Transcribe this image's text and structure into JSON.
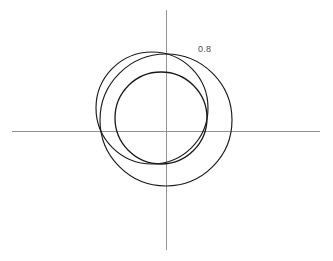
{
  "figure": {
    "background_color": "#ffffff",
    "width": 333,
    "height": 261
  },
  "axes": {
    "x_axis": {
      "name": "horizontal-axis",
      "color": "#8a8a8a",
      "y": 131,
      "x_start": 12,
      "x_end": 320
    },
    "y_axis": {
      "name": "vertical-axis",
      "color": "#8a8a8a",
      "x": 166,
      "y_start": 10,
      "y_end": 250
    },
    "origin": {
      "x": 166,
      "y": 131
    }
  },
  "annotations": [
    {
      "id": "label-08",
      "text": "0.8",
      "x": 198,
      "y": 44,
      "color": "#4a4a4a"
    }
  ],
  "chart_data": {
    "type": "scatter",
    "title": "",
    "subtitle": "",
    "xlabel": "",
    "ylabel": "",
    "grid": false,
    "legend": null,
    "axis_origin_px": {
      "x": 166,
      "y": 131
    },
    "annotations": [
      {
        "label": "0.8",
        "px": {
          "x": 198,
          "y": 44
        }
      }
    ],
    "series": [
      {
        "name": "circle-outer-right",
        "shape": "circle",
        "center_px": {
          "x": 166,
          "y": 120
        },
        "radius_px": 66,
        "stroke": "#1a1a1a",
        "stroke_width": 1.15
      },
      {
        "name": "circle-upper-left",
        "shape": "circle",
        "center_px": {
          "x": 152,
          "y": 108
        },
        "radius_px": 56,
        "stroke": "#1a1a1a",
        "stroke_width": 1.15
      },
      {
        "name": "circle-inner",
        "shape": "circle",
        "center_px": {
          "x": 161,
          "y": 118
        },
        "radius_px": 46,
        "stroke": "#1a1a1a",
        "stroke_width": 1.3
      }
    ]
  }
}
